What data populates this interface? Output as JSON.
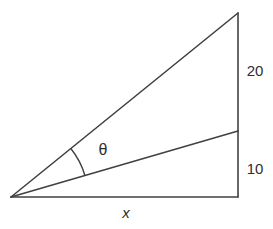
{
  "figure": {
    "angle_label": "θ",
    "upper_right_segment_label": "20",
    "lower_right_segment_label": "10",
    "base_label": "x"
  },
  "colors": {
    "line": "#414141",
    "text": "#2e2e2e",
    "background": "#ffffff"
  }
}
